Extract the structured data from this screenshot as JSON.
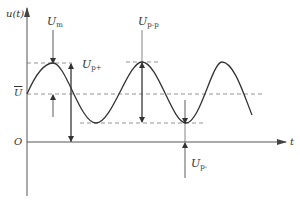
{
  "diagram": {
    "title": "",
    "axes": {
      "y_label": "u(t)",
      "x_label": "t",
      "origin_label": "O"
    },
    "levels": {
      "mean_label": "U",
      "mean_has_overbar": true
    },
    "annotations": [
      {
        "id": "um",
        "base": "U",
        "sub": "m",
        "meaning": "amplitude from mean to peak"
      },
      {
        "id": "upplus",
        "base": "U",
        "sub": "p+",
        "meaning": "positive peak value from zero"
      },
      {
        "id": "upp",
        "base": "U",
        "sub": "p-p",
        "meaning": "peak-to-peak value"
      },
      {
        "id": "upminus",
        "base": "U",
        "sub": "p-",
        "meaning": "negative peak value from zero"
      }
    ],
    "waveform": {
      "type": "sinusoid with DC offset",
      "cycles_shown": 2.6
    },
    "colors": {
      "line": "#333333",
      "dashed": "#666666",
      "axis": "#555555"
    }
  }
}
